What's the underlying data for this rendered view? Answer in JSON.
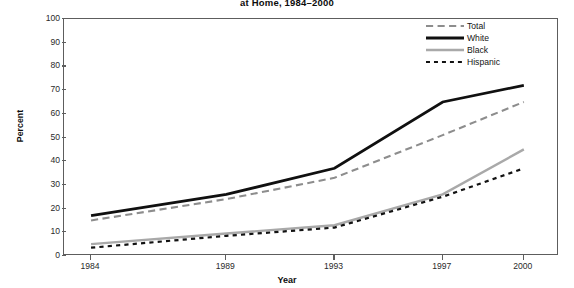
{
  "chart_data": {
    "type": "line",
    "title": "at Home, 1984–2000",
    "xlabel": "Year",
    "ylabel": "Percent",
    "x": [
      1984,
      1989,
      1993,
      1997,
      2000
    ],
    "xtick_labels": [
      "1984",
      "1989",
      "1993",
      "1997",
      "2000"
    ],
    "ytick_labels": [
      "0",
      "10",
      "20",
      "30",
      "40",
      "50",
      "60",
      "70",
      "80",
      "90",
      "100"
    ],
    "yticks": [
      0,
      10,
      20,
      30,
      40,
      50,
      60,
      70,
      80,
      90,
      100
    ],
    "ylim": [
      0,
      100
    ],
    "grid": false,
    "legend_position": "top-right",
    "series": [
      {
        "name": "Total",
        "values": [
          15,
          24,
          33,
          51,
          65
        ],
        "color": "#8d8d8d",
        "style": "dashed",
        "width": 2.1
      },
      {
        "name": "White",
        "values": [
          17,
          26,
          37,
          65,
          72
        ],
        "color": "#101010",
        "style": "solid",
        "width": 2.8
      },
      {
        "name": "Black",
        "values": [
          5,
          9.5,
          13,
          26,
          45
        ],
        "color": "#a9a9a9",
        "style": "solid",
        "width": 2.4
      },
      {
        "name": "Hispanic",
        "values": [
          3.5,
          8.5,
          12,
          25,
          37
        ],
        "color": "#121212",
        "style": "dotted",
        "width": 2.2
      }
    ]
  },
  "legend": {
    "items": [
      {
        "label": "Total",
        "color": "#8d8d8d",
        "style": "dashed"
      },
      {
        "label": "White",
        "color": "#101010",
        "style": "solid"
      },
      {
        "label": "Black",
        "color": "#a9a9a9",
        "style": "solid"
      },
      {
        "label": "Hispanic",
        "color": "#121212",
        "style": "dotted"
      }
    ]
  },
  "colors": {
    "axis": "#5d5d5d",
    "text": "#141414",
    "background": "#ffffff"
  }
}
